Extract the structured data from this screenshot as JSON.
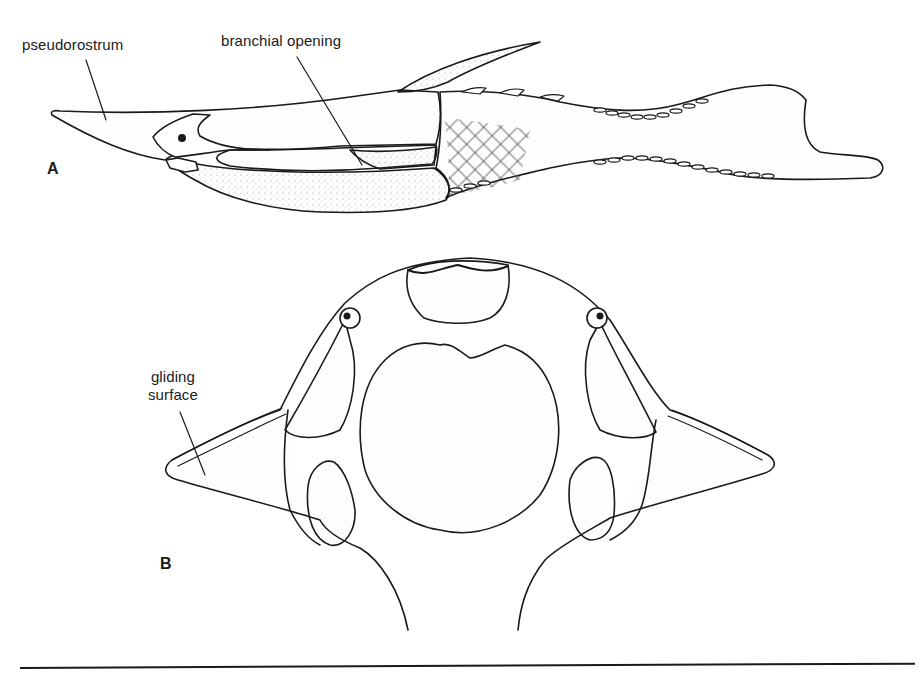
{
  "figure": {
    "panels": [
      {
        "id": "A",
        "letter": "A",
        "view": "lateral",
        "labels": {
          "pseudorostrum": "pseudorostrum",
          "branchial_opening": "branchial opening"
        }
      },
      {
        "id": "B",
        "letter": "B",
        "view": "anterior-ventral",
        "labels": {
          "gliding_surface_line1": "gliding",
          "gliding_surface_line2": "surface"
        }
      }
    ],
    "colors": {
      "ink": "#1a1a1a",
      "paper": "#ffffff",
      "stipple": "#9a9a9a"
    }
  }
}
